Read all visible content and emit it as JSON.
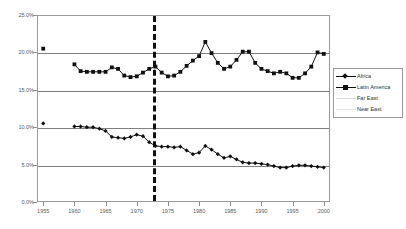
{
  "chart_data": {
    "type": "line",
    "title": "",
    "subtitle": "",
    "xlabel": "",
    "ylabel": "",
    "xlim": [
      1954,
      2001
    ],
    "ylim": [
      0.0,
      25.0
    ],
    "ytick_labels": [
      "0.0%",
      "5.0%",
      "10.0%",
      "15.0%",
      "20.0%",
      "25.0%"
    ],
    "ytick_values": [
      0,
      5,
      10,
      15,
      20,
      25
    ],
    "xtick_labels": [
      "1955",
      "1960",
      "1965",
      "1970",
      "1975",
      "1980",
      "1985",
      "1990",
      "1995",
      "2000"
    ],
    "xtick_values": [
      1955,
      1960,
      1965,
      1970,
      1975,
      1980,
      1985,
      1990,
      1995,
      2000
    ],
    "grid": "horizontal",
    "legend_position": "right",
    "annotations": [
      {
        "name": "vertical-divider",
        "type": "vline",
        "x": 1972.5,
        "style": "dashed",
        "color": "#101010"
      }
    ],
    "series": [
      {
        "name": "Africa",
        "marker": "diamond",
        "color": "#101010",
        "x": [
          1955,
          1960,
          1961,
          1962,
          1963,
          1964,
          1965,
          1966,
          1967,
          1968,
          1969,
          1970,
          1971,
          1972,
          1973,
          1974,
          1975,
          1976,
          1977,
          1978,
          1979,
          1980,
          1981,
          1982,
          1983,
          1984,
          1985,
          1986,
          1987,
          1988,
          1989,
          1990,
          1991,
          1992,
          1993,
          1994,
          1995,
          1996,
          1997,
          1998,
          1999,
          2000
        ],
        "values": [
          10.5,
          10.1,
          10.1,
          10.0,
          10.0,
          9.8,
          9.5,
          8.7,
          8.6,
          8.5,
          8.7,
          9.0,
          8.8,
          8.0,
          7.5,
          7.4,
          7.4,
          7.3,
          7.4,
          6.9,
          6.4,
          6.6,
          7.5,
          7.0,
          6.4,
          5.9,
          6.1,
          5.7,
          5.3,
          5.2,
          5.2,
          5.1,
          5.0,
          4.8,
          4.6,
          4.6,
          4.8,
          4.9,
          4.9,
          4.8,
          4.7,
          4.6
        ]
      },
      {
        "name": "Latin America",
        "marker": "square",
        "color": "#101010",
        "x": [
          1955,
          1960,
          1961,
          1962,
          1963,
          1964,
          1965,
          1966,
          1967,
          1968,
          1969,
          1970,
          1971,
          1972,
          1973,
          1974,
          1975,
          1976,
          1977,
          1978,
          1979,
          1980,
          1981,
          1982,
          1983,
          1984,
          1985,
          1986,
          1987,
          1988,
          1989,
          1990,
          1991,
          1992,
          1993,
          1994,
          1995,
          1996,
          1997,
          1998,
          1999,
          2000
        ],
        "values": [
          20.5,
          18.4,
          17.5,
          17.4,
          17.4,
          17.4,
          17.4,
          18.0,
          17.8,
          16.9,
          16.7,
          16.8,
          17.3,
          17.8,
          18.1,
          17.3,
          16.8,
          16.9,
          17.4,
          18.2,
          18.9,
          19.5,
          21.4,
          19.9,
          18.6,
          17.8,
          18.1,
          19.0,
          20.1,
          20.1,
          18.6,
          17.8,
          17.5,
          17.2,
          17.4,
          17.2,
          16.6,
          16.6,
          17.2,
          18.1,
          20.0,
          19.8
        ]
      },
      {
        "name": "Far East",
        "marker": "none",
        "color": "#d8d8d8",
        "x": [
          1955,
          1960,
          1965,
          1970,
          1975,
          1980,
          1985,
          1990,
          1995,
          2000
        ],
        "values": [
          1.0,
          1.2,
          1.4,
          1.6,
          1.8,
          2.0,
          2.3,
          2.6,
          2.9,
          3.2
        ]
      },
      {
        "name": "Near East",
        "marker": "none",
        "color": "#e4e4e4",
        "x": [
          1955,
          1960,
          1965,
          1970,
          1975,
          1980,
          1985,
          1990,
          1995,
          2000
        ],
        "values": [
          0.9,
          1.0,
          1.2,
          1.4,
          1.6,
          1.8,
          2.0,
          2.3,
          2.6,
          2.9
        ]
      }
    ]
  },
  "legend": {
    "items": [
      {
        "label": "Africa",
        "marker": "diamond",
        "color": "#101010",
        "line": true
      },
      {
        "label": "Latin America",
        "marker": "square",
        "color": "#101010",
        "line": true
      },
      {
        "label": "Far East",
        "marker": "none",
        "color": "#d8d8d8",
        "line": true
      },
      {
        "label": "Near East",
        "marker": "none",
        "color": "#e4e4e4",
        "line": true
      }
    ]
  }
}
